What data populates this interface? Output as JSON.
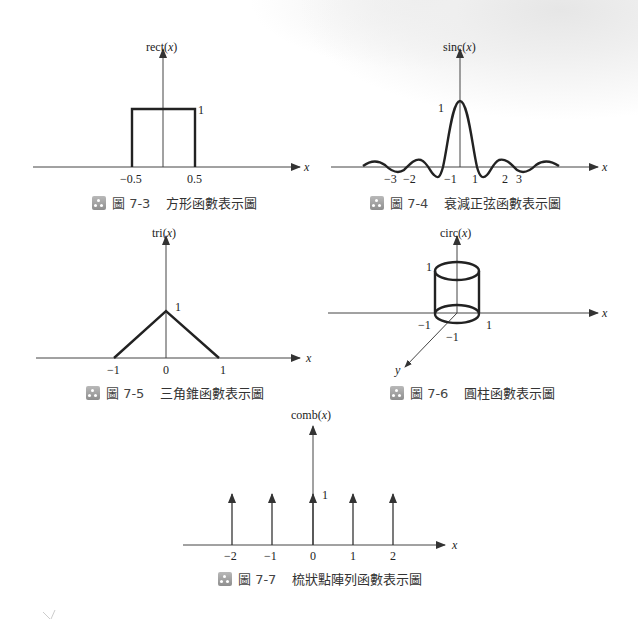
{
  "figures": [
    {
      "id": "fig-7-3",
      "caption": {
        "figure_label": "圖 7-3",
        "title": "方形函數表示圖"
      },
      "y_label": "rect(x)",
      "x_label": "x",
      "tick_labels": [
        "−0.5",
        "0.5"
      ],
      "height_label": "1"
    },
    {
      "id": "fig-7-4",
      "caption": {
        "figure_label": "圖 7-4",
        "title": "衰減正弦函數表示圖"
      },
      "y_label": "sinc(x)",
      "x_label": "x",
      "tick_labels": [
        "−3",
        "−2",
        "−1",
        "1",
        "2",
        "3"
      ],
      "height_label": "1"
    },
    {
      "id": "fig-7-5",
      "caption": {
        "figure_label": "圖 7-5",
        "title": "三角錐函數表示圖"
      },
      "y_label": "tri(x)",
      "x_label": "x",
      "tick_labels": [
        "−1",
        "0",
        "1"
      ],
      "height_label": "1"
    },
    {
      "id": "fig-7-6",
      "caption": {
        "figure_label": "圖 7-6",
        "title": "圓柱函數表示圖"
      },
      "y_label": "circ(x)",
      "x_label": "x",
      "y_axis_label": "y",
      "tick_labels": [
        "−1",
        "1",
        "−1"
      ],
      "height_label": "1"
    },
    {
      "id": "fig-7-7",
      "caption": {
        "figure_label": "圖 7-7",
        "title": "梳狀點陣列函數表示圖"
      },
      "y_label": "comb(x)",
      "x_label": "x",
      "tick_labels": [
        "−2",
        "−1",
        "0",
        "1",
        "2"
      ],
      "height_label": "1"
    }
  ],
  "chart_data": [
    {
      "type": "line",
      "title": "rect(x)",
      "xlabel": "x",
      "ylabel": "rect(x)",
      "x": [
        -0.5,
        -0.5,
        0.5,
        0.5
      ],
      "y": [
        0,
        1,
        1,
        0
      ],
      "xticks": [
        -0.5,
        0.5
      ]
    },
    {
      "type": "line",
      "title": "sinc(x)",
      "xlabel": "x",
      "ylabel": "sinc(x)",
      "x": [
        -4.5,
        -3.5,
        -3,
        -2.5,
        -2,
        -1.5,
        -1,
        0,
        1,
        1.5,
        2,
        2.5,
        3,
        3.5,
        4.5
      ],
      "y": [
        0.07,
        -0.09,
        0,
        0.13,
        0,
        -0.21,
        0,
        1,
        0,
        -0.21,
        0,
        0.13,
        0,
        -0.09,
        0.07
      ],
      "xticks": [
        -3,
        -2,
        -1,
        1,
        2,
        3
      ]
    },
    {
      "type": "line",
      "title": "tri(x)",
      "xlabel": "x",
      "ylabel": "tri(x)",
      "x": [
        -1,
        0,
        1
      ],
      "y": [
        0,
        1,
        0
      ],
      "xticks": [
        -1,
        0,
        1
      ]
    },
    {
      "type": "diagram",
      "title": "circ(x)",
      "description": "cylinder of radius 1, height 1 on x-y plane",
      "radius": 1,
      "height": 1,
      "xticks": [
        -1,
        1
      ],
      "yticks": [
        -1
      ]
    },
    {
      "type": "bar",
      "title": "comb(x)",
      "xlabel": "x",
      "ylabel": "comb(x)",
      "categories": [
        -2,
        -1,
        0,
        1,
        2
      ],
      "values": [
        1,
        1,
        1,
        1,
        1
      ],
      "style": "impulse-arrows"
    }
  ]
}
